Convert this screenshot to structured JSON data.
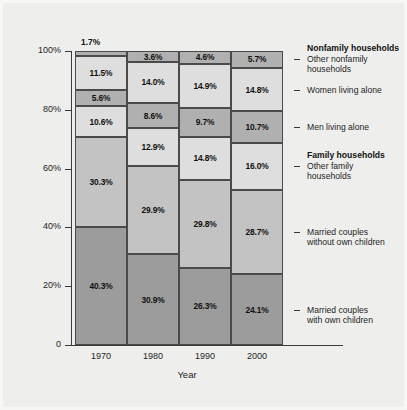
{
  "chart_data": {
    "type": "bar",
    "subtype": "stacked-bar-100",
    "title": "",
    "xlabel": "Year",
    "ylabel": "% of Households",
    "categories": [
      "1970",
      "1980",
      "1990",
      "2000"
    ],
    "ylim": [
      0,
      100
    ],
    "ytick_labels": [
      "0",
      "20%",
      "40%",
      "60%",
      "80%",
      "100%"
    ],
    "ytick_values": [
      0,
      20,
      40,
      60,
      80,
      100
    ],
    "grid": false,
    "legend_position": "right",
    "series": [
      {
        "name": "Married couples with own children",
        "group": "Family households",
        "color": "#9c9c9c",
        "values": [
          40.3,
          30.9,
          26.3,
          24.1
        ],
        "labels": [
          "40.3%",
          "30.9%",
          "26.3%",
          "24.1%"
        ]
      },
      {
        "name": "Married couples without own children",
        "group": "Family households",
        "color": "#c3c3c3",
        "values": [
          30.3,
          29.9,
          29.8,
          28.7
        ],
        "labels": [
          "30.3%",
          "29.9%",
          "29.8%",
          "28.7%"
        ]
      },
      {
        "name": "Other family households",
        "group": "Family households",
        "color": "#dedede",
        "values": [
          10.6,
          12.9,
          14.8,
          16.0
        ],
        "labels": [
          "10.6%",
          "12.9%",
          "14.8%",
          "16.0%"
        ]
      },
      {
        "name": "Men living alone",
        "group": "Nonfamily households",
        "color": "#b0b0b0",
        "values": [
          5.6,
          8.6,
          9.7,
          10.7
        ],
        "labels": [
          "5.6%",
          "8.6%",
          "9.7%",
          "10.7%"
        ]
      },
      {
        "name": "Women living alone",
        "group": "Nonfamily households",
        "color": "#dedede",
        "values": [
          11.5,
          14.0,
          14.9,
          14.8
        ],
        "labels": [
          "11.5%",
          "14.0%",
          "14.9%",
          "14.8%"
        ]
      },
      {
        "name": "Other nonfamily households",
        "group": "Nonfamily households",
        "color": "#b0b0b0",
        "values": [
          1.7,
          3.6,
          4.6,
          5.7
        ],
        "labels": [
          "1.7%",
          "3.6%",
          "4.6%",
          "5.7%"
        ]
      }
    ]
  },
  "axes": {
    "ytitle": "% of Households",
    "xtitle": "Year",
    "yticks": [
      {
        "label": "100%",
        "value": 100
      },
      {
        "label": "80%",
        "value": 80
      },
      {
        "label": "60%",
        "value": 60
      },
      {
        "label": "40%",
        "value": 40
      },
      {
        "label": "20%",
        "value": 20
      },
      {
        "label": "0",
        "value": 0
      }
    ],
    "xticks": [
      "1970",
      "1980",
      "1990",
      "2000"
    ]
  },
  "legend": {
    "heading_nonfamily": "Nonfamily households",
    "heading_family": "Family households",
    "items": [
      {
        "line1": "Other nonfamily",
        "line2": "households"
      },
      {
        "line1": "Women living alone",
        "line2": ""
      },
      {
        "line1": "Men living alone",
        "line2": ""
      },
      {
        "line1": "Other family",
        "line2": "households"
      },
      {
        "line1": "Married couples",
        "line2": "without own children"
      },
      {
        "line1": "Married couples",
        "line2": "with own children"
      }
    ]
  }
}
